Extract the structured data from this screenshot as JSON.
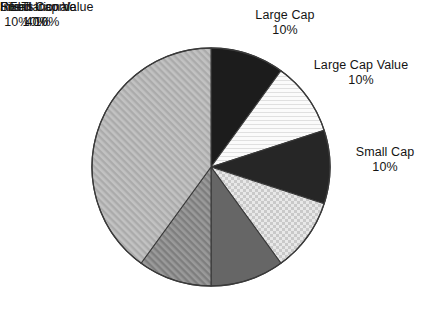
{
  "chart_data": {
    "type": "pie",
    "title": "",
    "subtitle": "",
    "xlabel": "",
    "ylabel": "",
    "legend_position": "none",
    "labels_position": "outside",
    "grid": false,
    "start_angle_deg": 0,
    "direction": "clockwise",
    "units": "percent",
    "categories": [
      "Large Cap",
      "Large Cap Value",
      "Small Cap",
      "Small Cap Value",
      "International",
      "REITs",
      "Fixed Income"
    ],
    "values": [
      10,
      10,
      10,
      10,
      10,
      10,
      40
    ],
    "value_labels": [
      "10%",
      "10%",
      "10%",
      "10%",
      "10%",
      "10%",
      "40%"
    ],
    "total": 100,
    "slices": [
      {
        "label": "Large Cap",
        "value": 10,
        "value_label": "10%",
        "fill": "#1c1c1c",
        "pattern": "solid",
        "start_deg": 0,
        "end_deg": 36
      },
      {
        "label": "Large Cap Value",
        "value": 10,
        "value_label": "10%",
        "fill": "#f2f2f2",
        "pattern": "fine-horizontal-lines",
        "start_deg": 36,
        "end_deg": 72
      },
      {
        "label": "Small Cap",
        "value": 10,
        "value_label": "10%",
        "fill": "#262626",
        "pattern": "solid",
        "start_deg": 72,
        "end_deg": 108
      },
      {
        "label": "Small Cap Value",
        "value": 10,
        "value_label": "10%",
        "fill": "#dcdcdc",
        "pattern": "checkered",
        "start_deg": 108,
        "end_deg": 144
      },
      {
        "label": "International",
        "value": 10,
        "value_label": "10%",
        "fill": "#666666",
        "pattern": "solid",
        "start_deg": 144,
        "end_deg": 180
      },
      {
        "label": "REITs",
        "value": 10,
        "value_label": "10%",
        "fill": "#8f8f8f",
        "pattern": "diagonal-hatch",
        "start_deg": 180,
        "end_deg": 216
      },
      {
        "label": "Fixed Income",
        "value": 40,
        "value_label": "40%",
        "fill": "#b6b6b6",
        "pattern": "diagonal-hatch-light",
        "start_deg": 216,
        "end_deg": 360
      }
    ]
  },
  "labels": {
    "large_cap": {
      "name": "Large Cap",
      "pct": "10%"
    },
    "large_cap_value": {
      "name": "Large Cap Value",
      "pct": "10%"
    },
    "small_cap": {
      "name": "Small Cap",
      "pct": "10%"
    },
    "small_cap_value": {
      "name": "Small Cap Value",
      "pct": "10%"
    },
    "international": {
      "name": "International",
      "pct": "10%"
    },
    "reits": {
      "name": "REITs",
      "pct": "10%"
    },
    "fixed_income": {
      "name": "Fixed Income",
      "pct": "40%"
    }
  },
  "style": {
    "outline": "#3a3a3a",
    "background": "#ffffff",
    "text": "#141414"
  }
}
